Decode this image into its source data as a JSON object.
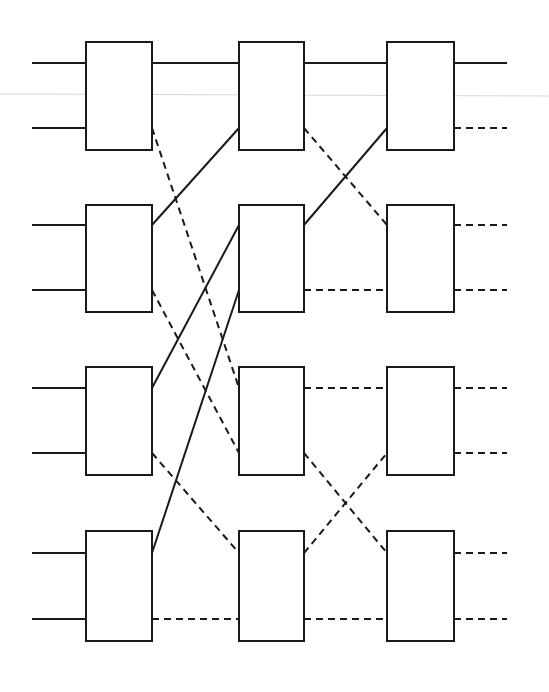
{
  "diagram": {
    "type": "butterfly-switching-network",
    "stages": 3,
    "rows_per_stage": 4,
    "colors": {
      "stroke": "#1a1a1a",
      "background": "#ffffff"
    },
    "columns": [
      {
        "x": 86,
        "width": 66
      },
      {
        "x": 239,
        "width": 65
      },
      {
        "x": 387,
        "width": 67
      }
    ],
    "rows": [
      {
        "top": 42,
        "height": 108,
        "port_top_y": 63,
        "port_bottom_y": 128
      },
      {
        "top": 205,
        "height": 107,
        "port_top_y": 225,
        "port_bottom_y": 290
      },
      {
        "top": 367,
        "height": 108,
        "port_top_y": 388,
        "port_bottom_y": 453
      },
      {
        "top": 531,
        "height": 110,
        "port_top_y": 553,
        "port_bottom_y": 619
      }
    ],
    "inputs": [
      {
        "row": 0,
        "port": "top",
        "style": "solid"
      },
      {
        "row": 0,
        "port": "bottom",
        "style": "solid"
      },
      {
        "row": 1,
        "port": "top",
        "style": "solid"
      },
      {
        "row": 1,
        "port": "bottom",
        "style": "solid"
      },
      {
        "row": 2,
        "port": "top",
        "style": "solid"
      },
      {
        "row": 2,
        "port": "bottom",
        "style": "solid"
      },
      {
        "row": 3,
        "port": "top",
        "style": "solid"
      },
      {
        "row": 3,
        "port": "bottom",
        "style": "solid"
      }
    ],
    "outputs": [
      {
        "row": 0,
        "port": "top",
        "style": "solid"
      },
      {
        "row": 0,
        "port": "bottom",
        "style": "dashed"
      },
      {
        "row": 1,
        "port": "top",
        "style": "dashed"
      },
      {
        "row": 1,
        "port": "bottom",
        "style": "dashed"
      },
      {
        "row": 2,
        "port": "top",
        "style": "dashed"
      },
      {
        "row": 2,
        "port": "bottom",
        "style": "dashed"
      },
      {
        "row": 3,
        "port": "top",
        "style": "dashed"
      },
      {
        "row": 3,
        "port": "bottom",
        "style": "dashed"
      }
    ],
    "connections": [
      {
        "from": [
          0,
          0,
          "top"
        ],
        "to": [
          1,
          0,
          "top"
        ],
        "style": "solid"
      },
      {
        "from": [
          0,
          0,
          "bottom"
        ],
        "to": [
          1,
          2,
          "top"
        ],
        "style": "dashed"
      },
      {
        "from": [
          0,
          1,
          "top"
        ],
        "to": [
          1,
          0,
          "bottom"
        ],
        "style": "solid"
      },
      {
        "from": [
          0,
          1,
          "bottom"
        ],
        "to": [
          1,
          2,
          "bottom"
        ],
        "style": "dashed"
      },
      {
        "from": [
          0,
          2,
          "top"
        ],
        "to": [
          1,
          1,
          "top"
        ],
        "style": "solid"
      },
      {
        "from": [
          0,
          2,
          "bottom"
        ],
        "to": [
          1,
          3,
          "top"
        ],
        "style": "dashed"
      },
      {
        "from": [
          0,
          3,
          "top"
        ],
        "to": [
          1,
          1,
          "bottom"
        ],
        "style": "solid"
      },
      {
        "from": [
          0,
          3,
          "bottom"
        ],
        "to": [
          1,
          3,
          "bottom"
        ],
        "style": "dashed"
      },
      {
        "from": [
          1,
          0,
          "top"
        ],
        "to": [
          2,
          0,
          "top"
        ],
        "style": "solid"
      },
      {
        "from": [
          1,
          0,
          "bottom"
        ],
        "to": [
          2,
          1,
          "top"
        ],
        "style": "dashed"
      },
      {
        "from": [
          1,
          1,
          "top"
        ],
        "to": [
          2,
          0,
          "bottom"
        ],
        "style": "solid"
      },
      {
        "from": [
          1,
          1,
          "bottom"
        ],
        "to": [
          2,
          1,
          "bottom"
        ],
        "style": "dashed"
      },
      {
        "from": [
          1,
          2,
          "top"
        ],
        "to": [
          2,
          2,
          "top"
        ],
        "style": "dashed"
      },
      {
        "from": [
          1,
          2,
          "bottom"
        ],
        "to": [
          2,
          3,
          "top"
        ],
        "style": "dashed"
      },
      {
        "from": [
          1,
          3,
          "top"
        ],
        "to": [
          2,
          2,
          "bottom"
        ],
        "style": "dashed"
      },
      {
        "from": [
          1,
          3,
          "bottom"
        ],
        "to": [
          2,
          3,
          "bottom"
        ],
        "style": "dashed"
      }
    ],
    "input_x_start": 32,
    "output_x_end": 507
  }
}
